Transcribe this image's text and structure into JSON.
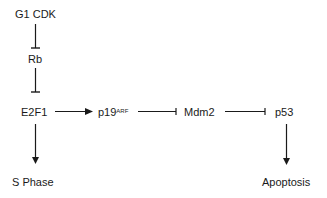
{
  "diagram": {
    "type": "signaling-pathway",
    "nodes": {
      "g1cdk": {
        "label": "G1 CDK"
      },
      "rb": {
        "label": "Rb"
      },
      "e2f1": {
        "label": "E2F1"
      },
      "p19": {
        "label": "p19",
        "superscript": "ARF"
      },
      "mdm2": {
        "label": "Mdm2"
      },
      "p53": {
        "label": "p53"
      },
      "sphase": {
        "label": "S Phase"
      },
      "apoptosis": {
        "label": "Apoptosis"
      }
    },
    "edges": [
      {
        "from": "G1 CDK",
        "to": "Rb",
        "type": "inhibition"
      },
      {
        "from": "Rb",
        "to": "E2F1",
        "type": "inhibition"
      },
      {
        "from": "E2F1",
        "to": "p19ARF",
        "type": "activation"
      },
      {
        "from": "p19ARF",
        "to": "Mdm2",
        "type": "inhibition"
      },
      {
        "from": "Mdm2",
        "to": "p53",
        "type": "inhibition"
      },
      {
        "from": "E2F1",
        "to": "S Phase",
        "type": "activation"
      },
      {
        "from": "p53",
        "to": "Apoptosis",
        "type": "activation"
      }
    ],
    "colors": {
      "line": "#1a1a1a",
      "background": "#ffffff"
    }
  }
}
